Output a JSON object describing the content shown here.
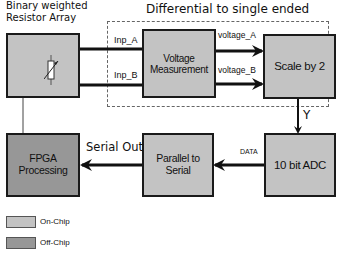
{
  "diagram": {
    "group_title": "Differential to single ended",
    "resistor_array_title_line1": "Binary weighted",
    "resistor_array_title_line2": "Resistor Array",
    "blocks": {
      "resistor_array": {
        "label": "",
        "type": "on-chip",
        "icon": "variable-resistor-icon"
      },
      "voltage_measurement": {
        "label": "Voltage Measurement",
        "type": "on-chip"
      },
      "scale": {
        "label": "Scale by 2",
        "type": "on-chip"
      },
      "adc": {
        "label": "10 bit ADC",
        "type": "on-chip"
      },
      "parallel_to_serial": {
        "label": "Parallel to Serial",
        "type": "on-chip"
      },
      "fpga": {
        "label": "FPGA Processing",
        "type": "off-chip"
      }
    },
    "signals": {
      "inp_a": "Inp_A",
      "inp_b": "Inp_B",
      "voltage_a": "voltage_A",
      "voltage_b": "voltage_B",
      "y": "Y",
      "data": "DATA",
      "serial_out": "Serial Out"
    },
    "edges": [
      {
        "from": "resistor_array",
        "to": "voltage_measurement",
        "label": "Inp_A"
      },
      {
        "from": "resistor_array",
        "to": "voltage_measurement",
        "label": "Inp_B"
      },
      {
        "from": "voltage_measurement",
        "to": "scale",
        "label": "voltage_A"
      },
      {
        "from": "voltage_measurement",
        "to": "scale",
        "label": "voltage_B"
      },
      {
        "from": "scale",
        "to": "adc",
        "label": "Y"
      },
      {
        "from": "adc",
        "to": "parallel_to_serial",
        "label": "DATA"
      },
      {
        "from": "parallel_to_serial",
        "to": "fpga",
        "label": "Serial Out"
      },
      {
        "from": "fpga",
        "to": "resistor_array",
        "label": ""
      }
    ]
  },
  "legend": {
    "items": [
      {
        "label": "On-Chip",
        "color": "#c3c3c3"
      },
      {
        "label": "Off-Chip",
        "color": "#979797"
      }
    ]
  },
  "colors": {
    "on_chip": "#c3c3c3",
    "off_chip": "#979797",
    "stroke": "#1a1a1a",
    "dashed_group": "#666666"
  }
}
